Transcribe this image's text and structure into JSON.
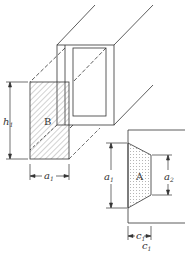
{
  "diagram": {
    "labels": {
      "region_b": "B",
      "region_a": "A",
      "h1": "h",
      "h1_sub": "1",
      "a1_bottom": "a",
      "a1_bottom_sub": "1",
      "a1_right": "a",
      "a1_right_sub": "1",
      "a2": "a",
      "a2_sub": "2",
      "c1_inner": "c",
      "c1_inner_sub": "1",
      "c1_outer": "c",
      "c1_outer_sub": "1"
    },
    "colors": {
      "stroke": "#333333",
      "hatch": "#555555",
      "dots": "#666666",
      "background": "#ffffff"
    }
  }
}
